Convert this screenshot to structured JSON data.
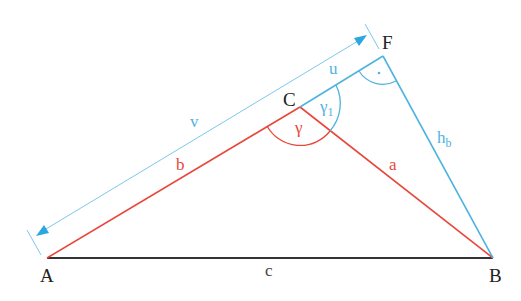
{
  "diagram": {
    "colors": {
      "triangle_sides": "#e8473a",
      "construction": "#4fb3e0",
      "base": "#333333",
      "vertex_labels": "#222222",
      "background": "#ffffff"
    },
    "vertices": {
      "A": {
        "label": "A",
        "x": 47,
        "y": 258
      },
      "B": {
        "label": "B",
        "x": 493,
        "y": 258
      },
      "C": {
        "label": "C",
        "x": 300,
        "y": 107
      },
      "F": {
        "label": "F",
        "x": 383,
        "y": 56
      }
    },
    "sides": {
      "a": {
        "label": "a",
        "from": "C",
        "to": "B",
        "color": "red"
      },
      "b": {
        "label": "b",
        "from": "A",
        "to": "C",
        "color": "red"
      },
      "c": {
        "label": "c",
        "from": "A",
        "to": "B",
        "color": "black"
      }
    },
    "construction": {
      "u": {
        "label": "u",
        "from": "C",
        "to": "F"
      },
      "h_b": {
        "label": "h",
        "subscript": "b",
        "from": "F",
        "to": "B"
      },
      "v": {
        "label": "v",
        "dimension_from": "A",
        "dimension_to": "F",
        "arrows": "both"
      }
    },
    "angles": {
      "gamma": {
        "label": "γ",
        "vertex": "C",
        "color": "red"
      },
      "gamma1": {
        "label": "γ",
        "subscript": "1",
        "vertex": "C",
        "color": "blue"
      },
      "right_angle": {
        "label": "·",
        "vertex": "F",
        "color": "blue"
      }
    }
  }
}
